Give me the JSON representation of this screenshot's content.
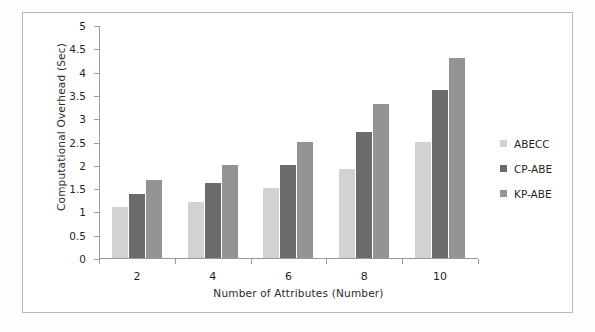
{
  "chart_data": {
    "type": "bar",
    "title": "",
    "xlabel": "Number of Attributes (Number)",
    "ylabel": "Computational Overhead (Sec)",
    "categories": [
      "2",
      "4",
      "6",
      "8",
      "10"
    ],
    "series": [
      {
        "name": "ABECC",
        "values": [
          1.1,
          1.2,
          1.5,
          1.9,
          2.5
        ],
        "color": "#d2d2d2"
      },
      {
        "name": "CP-ABE",
        "values": [
          1.38,
          1.6,
          2.0,
          2.7,
          3.6
        ],
        "color": "#6b6b6b"
      },
      {
        "name": "KP-ABE",
        "values": [
          1.68,
          2.0,
          2.5,
          3.3,
          4.3
        ],
        "color": "#949494"
      }
    ],
    "ylim": [
      0,
      5
    ],
    "ytick_step": 0.5,
    "yticks": [
      "0",
      "0.5",
      "1",
      "1.5",
      "2",
      "2.5",
      "3",
      "3.5",
      "4",
      "4.5",
      "5"
    ],
    "grid": false,
    "legend_position": "right"
  },
  "legend": {
    "items": [
      {
        "label": "ABECC"
      },
      {
        "label": "CP-ABE"
      },
      {
        "label": "KP-ABE"
      }
    ]
  },
  "frame": {
    "border_color": "#b9b9b9",
    "axis_color": "#9a9a9a"
  }
}
